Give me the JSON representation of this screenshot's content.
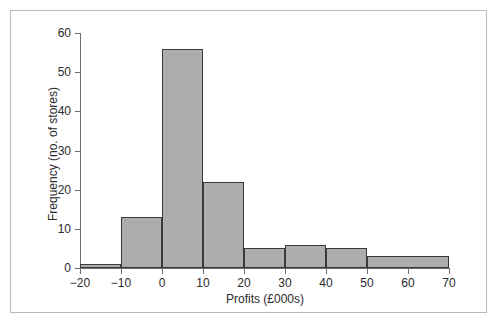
{
  "figure": {
    "background_color": "#ffffff",
    "frame_color": "#b9b9b9",
    "axis_color": "#6e6e6e",
    "bar_fill_color": "#adadad",
    "bar_edge_color": "#3a3a3a"
  },
  "chart_data": {
    "type": "bar",
    "title": "",
    "xlabel": "Profits (£000s)",
    "ylabel": "Frequency (no. of stores)",
    "xlim": [
      -20,
      70
    ],
    "ylim": [
      0,
      60
    ],
    "grid": false,
    "legend": false,
    "x_ticks": [
      -20,
      -10,
      0,
      10,
      20,
      30,
      40,
      50,
      60,
      70
    ],
    "x_tick_labels": [
      "−20",
      "−10",
      "0",
      "10",
      "20",
      "30",
      "40",
      "50",
      "60",
      "70"
    ],
    "y_ticks": [
      0,
      10,
      20,
      30,
      40,
      50,
      60
    ],
    "y_tick_labels": [
      "0",
      "10",
      "20",
      "30",
      "40",
      "50",
      "60"
    ],
    "bins": [
      {
        "label": "-20 to -10",
        "start": -20,
        "end": -10,
        "value": 1
      },
      {
        "label": "-10 to 0",
        "start": -10,
        "end": 0,
        "value": 13
      },
      {
        "label": "0 to 10",
        "start": 0,
        "end": 10,
        "value": 56
      },
      {
        "label": "10 to 20",
        "start": 10,
        "end": 20,
        "value": 22
      },
      {
        "label": "20 to 30",
        "start": 20,
        "end": 30,
        "value": 5
      },
      {
        "label": "30 to 40",
        "start": 30,
        "end": 40,
        "value": 6
      },
      {
        "label": "40 to 50",
        "start": 40,
        "end": 50,
        "value": 5
      },
      {
        "label": "50 to 70",
        "start": 50,
        "end": 70,
        "value": 3
      }
    ],
    "categories": [
      "-20 to -10",
      "-10 to 0",
      "0 to 10",
      "10 to 20",
      "20 to 30",
      "30 to 40",
      "40 to 50",
      "50 to 70"
    ],
    "values": [
      1,
      13,
      56,
      22,
      5,
      6,
      5,
      3
    ]
  }
}
